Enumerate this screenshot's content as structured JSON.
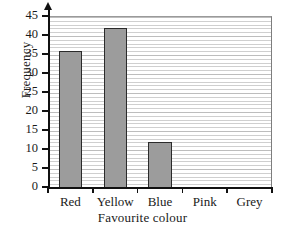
{
  "chart_data": {
    "type": "bar",
    "title": "",
    "categories": [
      "Red",
      "Yellow",
      "Blue",
      "Pink",
      "Grey"
    ],
    "values": [
      36,
      42,
      12,
      0,
      0
    ],
    "xlabel": "Favourite colour",
    "ylabel": "Frequency",
    "ylim": [
      0,
      45
    ],
    "ytick_labels": [
      "0",
      "5",
      "10",
      "15",
      "20",
      "25",
      "30",
      "35",
      "40",
      "45"
    ],
    "ytick_values": [
      0,
      5,
      10,
      15,
      20,
      25,
      30,
      35,
      40,
      45
    ],
    "y_major_step": 5,
    "y_minor_step": 1,
    "grid": true,
    "grid_orientation": "horizontal",
    "legend": null,
    "bar_fill_color": "#9c9c9c",
    "bar_edge_color": "#2b2b2b",
    "axis_color": "#111111",
    "gridline_color": "#cfcfcf",
    "background_color": "#ffffff",
    "y_axis_arrow": true
  }
}
